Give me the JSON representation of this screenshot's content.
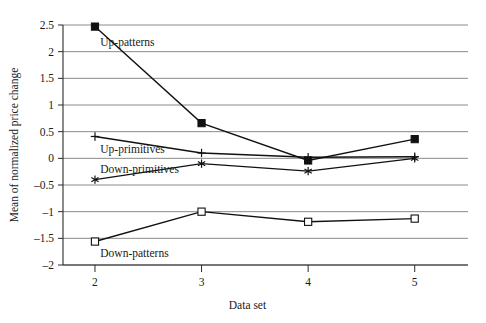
{
  "chart_data": {
    "type": "line",
    "title": "",
    "xlabel": "Data set",
    "ylabel": "Mean of normalized price change",
    "x": [
      2,
      3,
      4,
      5
    ],
    "xticklabels": [
      "2",
      "3",
      "4",
      "5"
    ],
    "yticklabels": [
      "2.5",
      "2",
      "1.5",
      "1",
      "0.5",
      "0",
      "-0.5",
      "-1",
      "-1.5",
      "-2"
    ],
    "yticks": [
      2.5,
      2,
      1.5,
      1,
      0.5,
      0,
      -0.5,
      -1,
      -1.5,
      -2
    ],
    "xlim": [
      1.7,
      5.5
    ],
    "ylim": [
      -2,
      2.5
    ],
    "grid": true,
    "legend": "inline-annotations",
    "series": [
      {
        "name": "Up-patterns",
        "marker": "filled-square",
        "values": [
          2.47,
          0.66,
          -0.04,
          0.36
        ]
      },
      {
        "name": "Up-primitives",
        "marker": "plus",
        "values": [
          0.41,
          0.1,
          0.02,
          0.03
        ]
      },
      {
        "name": "Down-primitives",
        "marker": "asterisk",
        "values": [
          -0.4,
          -0.1,
          -0.24,
          0.0
        ]
      },
      {
        "name": "Down-patterns",
        "marker": "open-square",
        "values": [
          -1.56,
          -1.0,
          -1.19,
          -1.13
        ]
      }
    ],
    "annotations": [
      {
        "text": "Up-patterns",
        "x": 2.05,
        "y": 2.18
      },
      {
        "text": "Up-primitives",
        "x": 2.05,
        "y": 0.18
      },
      {
        "text": "Down-primitives",
        "x": 2.05,
        "y": -0.2
      },
      {
        "text": "Down-patterns",
        "x": 2.05,
        "y": -1.78
      }
    ],
    "colors": {
      "line": "#111111",
      "grid": "#7d7d7d",
      "axis": "#2b2b2b",
      "background": "#ffffff"
    }
  }
}
